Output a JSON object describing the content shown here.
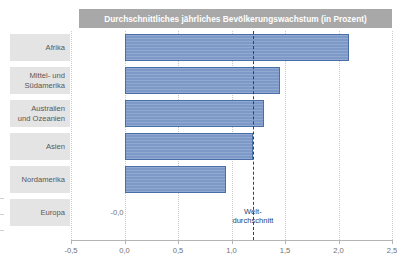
{
  "chart_data": {
    "type": "bar",
    "orientation": "horizontal",
    "title": "Durchschnittliches jährliches Bevölkerungswachstum (in Prozent)",
    "xlabel": "",
    "ylabel": "",
    "xlim": [
      -0.5,
      2.5
    ],
    "grid": true,
    "legend": "none",
    "categories": [
      "Afrika",
      "Mittel- und\nSüdamerika",
      "Australien\nund Ozeanien",
      "Asien",
      "Nordamerika",
      "Europa"
    ],
    "values": [
      2.1,
      1.45,
      1.3,
      1.2,
      0.95,
      -0.0
    ],
    "value_labels": [
      "",
      "",
      "",
      "",
      "",
      "-0,0"
    ],
    "xticks": [
      -0.5,
      0.0,
      0.5,
      1.0,
      1.5,
      2.0,
      2.5
    ],
    "xticklabels": [
      "-0,5",
      "0,0",
      "0,5",
      "1,0",
      "1,5",
      "2,0",
      "2,5"
    ],
    "annotations": [
      {
        "name": "world-average",
        "label": "Welt-\ndurchschnitt",
        "value": 1.2,
        "style": "dashed-vertical-line"
      }
    ],
    "colors": {
      "bar_fill": "#7d99c8",
      "bar_border": "#4a6ea8",
      "title_banner": "#a8a8a8",
      "title_text": "#ffffff",
      "category_chip": "#e4e4e4",
      "category_text": "#585858",
      "gridline": "#c9c9c9",
      "axis": "#b4b4b4",
      "axis_label": "#6f6f6f",
      "world_average": "#2c3e6b"
    }
  }
}
